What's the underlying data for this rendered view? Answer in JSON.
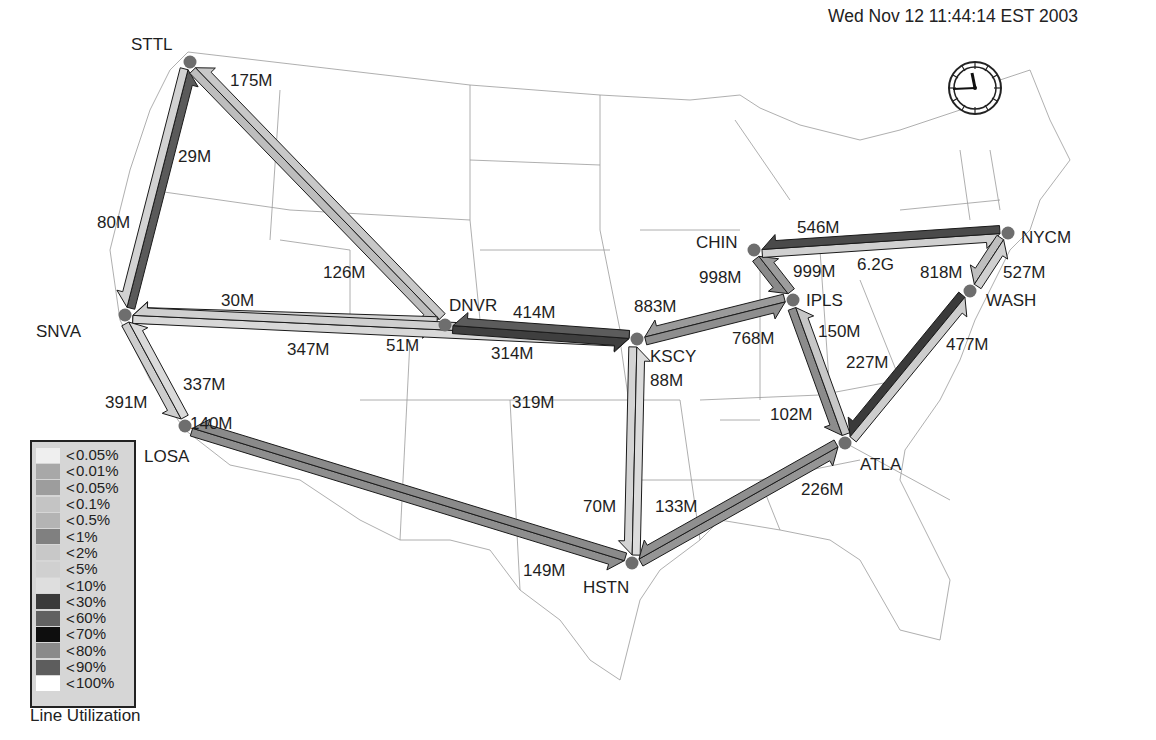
{
  "header": {
    "timestamp": "Wed Nov 12 11:44:14 EST 2003",
    "clock_icon": "analog-clock-icon",
    "clock_time": "11:44"
  },
  "nodes": [
    {
      "id": "STTL",
      "label": "STTL",
      "x": 190,
      "y": 62
    },
    {
      "id": "SNVA",
      "label": "SNVA",
      "x": 125,
      "y": 315
    },
    {
      "id": "LOSA",
      "label": "LOSA",
      "x": 185,
      "y": 426
    },
    {
      "id": "DNVR",
      "label": "DNVR",
      "x": 445,
      "y": 325
    },
    {
      "id": "KSCY",
      "label": "KSCY",
      "x": 637,
      "y": 339
    },
    {
      "id": "HSTN",
      "label": "HSTN",
      "x": 632,
      "y": 563
    },
    {
      "id": "CHIN",
      "label": "CHIN",
      "x": 754,
      "y": 250
    },
    {
      "id": "IPLS",
      "label": "IPLS",
      "x": 793,
      "y": 300
    },
    {
      "id": "ATLA",
      "label": "ATLA",
      "x": 845,
      "y": 443
    },
    {
      "id": "NYCM",
      "label": "NYCM",
      "x": 1008,
      "y": 233
    },
    {
      "id": "WASH",
      "label": "WASH",
      "x": 970,
      "y": 291
    }
  ],
  "links": [
    {
      "from": "SNVA",
      "to": "STTL",
      "forward": "80M",
      "reverse": "29M",
      "fwd_color": "#5a5a5a",
      "rev_color": "#d2d2d2"
    },
    {
      "from": "STTL",
      "to": "DNVR",
      "forward": "175M",
      "reverse": "126M",
      "fwd_color": "#bdbdbd",
      "rev_color": "#c8c8c8"
    },
    {
      "from": "SNVA",
      "to": "DNVR",
      "forward": "30M",
      "reverse": "51M",
      "fwd_color": "#9a9a9a",
      "rev_color": "#d4d4d4"
    },
    {
      "from": "SNVA",
      "to": "KSCY",
      "forward": "347M",
      "reverse": "319M",
      "fwd_color": "#d8d8d8",
      "rev_color": "#cfcfcf"
    },
    {
      "from": "SNVA",
      "to": "LOSA",
      "forward": "337M",
      "reverse": "391M",
      "fwd_color": "#cdcdcd",
      "rev_color": "#dadada"
    },
    {
      "from": "DNVR",
      "to": "KSCY",
      "forward": "414M",
      "reverse": "314M",
      "fwd_color": "#3f3f3f",
      "rev_color": "#5c5c5c"
    },
    {
      "from": "LOSA",
      "to": "HSTN",
      "forward": "149M",
      "reverse": "140M",
      "fwd_color": "#8e8e8e",
      "rev_color": "#8a8a8a"
    },
    {
      "from": "KSCY",
      "to": "HSTN",
      "forward": "70M",
      "reverse": "88M",
      "fwd_color": "#d4d4d4",
      "rev_color": "#dcdcdc"
    },
    {
      "from": "HSTN",
      "to": "ATLA",
      "forward": "226M",
      "reverse": "133M",
      "fwd_color": "#959595",
      "rev_color": "#8f8f8f"
    },
    {
      "from": "IPLS",
      "to": "KSCY",
      "forward": "883M",
      "reverse": "768M",
      "fwd_color": "#9a9a9a",
      "rev_color": "#8e8e8e"
    },
    {
      "from": "CHIN",
      "to": "IPLS",
      "forward": "999M",
      "reverse": "998M",
      "fwd_color": "#8a8a8a",
      "rev_color": "#9c9c9c"
    },
    {
      "from": "CHIN",
      "to": "NYCM",
      "forward": "546M",
      "reverse": "6.2G",
      "fwd_color": "#d0d0d0",
      "rev_color": "#4a4a4a"
    },
    {
      "from": "NYCM",
      "to": "WASH",
      "forward": "527M",
      "reverse": "818M",
      "fwd_color": "#bebebe",
      "rev_color": "#d0d0d0"
    },
    {
      "from": "IPLS",
      "to": "ATLA",
      "forward": "102M",
      "reverse": "150M",
      "fwd_color": "#8c8c8c",
      "rev_color": "#c7c7c7"
    },
    {
      "from": "WASH",
      "to": "ATLA",
      "forward": "477M",
      "reverse": "227M",
      "fwd_color": "#3a3a3a",
      "rev_color": "#cdcdcd"
    }
  ],
  "labels": [
    {
      "text": "175M",
      "x": 230,
      "y": 86
    },
    {
      "text": "29M",
      "x": 178,
      "y": 162
    },
    {
      "text": "80M",
      "x": 97,
      "y": 228
    },
    {
      "text": "126M",
      "x": 323,
      "y": 278
    },
    {
      "text": "30M",
      "x": 221,
      "y": 306
    },
    {
      "text": "DNVR",
      "x": 449,
      "y": 311
    },
    {
      "text": "414M",
      "x": 513,
      "y": 318
    },
    {
      "text": "883M",
      "x": 634,
      "y": 312
    },
    {
      "text": "SNVA",
      "x": 36,
      "y": 337
    },
    {
      "text": "51M",
      "x": 386,
      "y": 351
    },
    {
      "text": "347M",
      "x": 287,
      "y": 355
    },
    {
      "text": "314M",
      "x": 491,
      "y": 359
    },
    {
      "text": "KSCY",
      "x": 650,
      "y": 362
    },
    {
      "text": "88M",
      "x": 650,
      "y": 386
    },
    {
      "text": "337M",
      "x": 183,
      "y": 390
    },
    {
      "text": "319M",
      "x": 512,
      "y": 408
    },
    {
      "text": "391M",
      "x": 105,
      "y": 408
    },
    {
      "text": "140M",
      "x": 190,
      "y": 429
    },
    {
      "text": "LOSA",
      "x": 144,
      "y": 462
    },
    {
      "text": "70M",
      "x": 583,
      "y": 512
    },
    {
      "text": "133M",
      "x": 655,
      "y": 512
    },
    {
      "text": "149M",
      "x": 523,
      "y": 576
    },
    {
      "text": "HSTN",
      "x": 583,
      "y": 593
    },
    {
      "text": "CHIN",
      "x": 696,
      "y": 248
    },
    {
      "text": "546M",
      "x": 797,
      "y": 233
    },
    {
      "text": "998M",
      "x": 699,
      "y": 283
    },
    {
      "text": "999M",
      "x": 793,
      "y": 277
    },
    {
      "text": "6.2G",
      "x": 857,
      "y": 270
    },
    {
      "text": "818M",
      "x": 920,
      "y": 278
    },
    {
      "text": "527M",
      "x": 1003,
      "y": 278
    },
    {
      "text": "NYCM",
      "x": 1021,
      "y": 243
    },
    {
      "text": "IPLS",
      "x": 806,
      "y": 306
    },
    {
      "text": "WASH",
      "x": 986,
      "y": 306
    },
    {
      "text": "768M",
      "x": 732,
      "y": 344
    },
    {
      "text": "150M",
      "x": 818,
      "y": 337
    },
    {
      "text": "227M",
      "x": 846,
      "y": 368
    },
    {
      "text": "477M",
      "x": 946,
      "y": 350
    },
    {
      "text": "102M",
      "x": 770,
      "y": 420
    },
    {
      "text": "ATLA",
      "x": 860,
      "y": 470
    },
    {
      "text": "226M",
      "x": 801,
      "y": 495
    },
    {
      "text": "STTL",
      "x": 131,
      "y": 50
    }
  ],
  "legend": {
    "title": "Line Utilization",
    "items": [
      {
        "label": "0.05%",
        "color": "#efefef"
      },
      {
        "label": "0.01%",
        "color": "#a8a8a8"
      },
      {
        "label": "0.05%",
        "color": "#9d9d9d"
      },
      {
        "label": "0.1%",
        "color": "#c4c4c4"
      },
      {
        "label": "0.5%",
        "color": "#b4b4b4"
      },
      {
        "label": "1%",
        "color": "#808080"
      },
      {
        "label": "2%",
        "color": "#c8c8c8"
      },
      {
        "label": "5%",
        "color": "#d0d0d0"
      },
      {
        "label": "10%",
        "color": "#dedede"
      },
      {
        "label": "30%",
        "color": "#3a3a3a"
      },
      {
        "label": "60%",
        "color": "#616161"
      },
      {
        "label": "70%",
        "color": "#0e0e0e"
      },
      {
        "label": "80%",
        "color": "#8a8a8a"
      },
      {
        "label": "90%",
        "color": "#5d5d5d"
      },
      {
        "label": "100%",
        "color": "#ffffff"
      }
    ]
  }
}
